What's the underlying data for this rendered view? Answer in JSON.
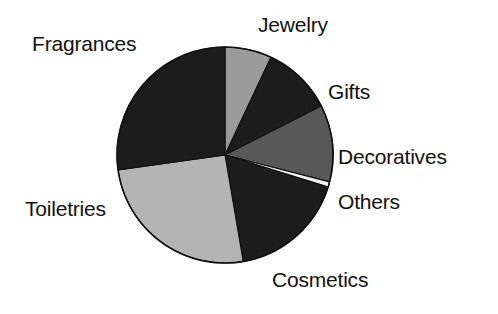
{
  "chart_data": {
    "type": "pie",
    "title": "",
    "subtitle": "",
    "xlabel": "",
    "ylabel": "",
    "legend_position": "none",
    "grid": false,
    "labels_outside": true,
    "start_angle_deg": 0,
    "direction": "clockwise",
    "center": {
      "x": 225,
      "y": 155
    },
    "radius": 108,
    "categories": [
      "Jewelry",
      "Gifts",
      "Decoratives",
      "Others",
      "Cosmetics",
      "Toiletries",
      "Fragrances"
    ],
    "values": [
      7.0,
      10.5,
      11.5,
      0.8,
      17.5,
      25.5,
      27.2
    ],
    "unit": "%",
    "slices": [
      {
        "label": "Jewelry",
        "value": 7.0,
        "start_deg": 0.0,
        "end_deg": 25.2,
        "color": "#9a9a9a"
      },
      {
        "label": "Gifts",
        "value": 10.5,
        "start_deg": 25.2,
        "end_deg": 63.0,
        "color": "#1c1c1c"
      },
      {
        "label": "Decoratives",
        "value": 11.5,
        "start_deg": 63.0,
        "end_deg": 104.4,
        "color": "#585858"
      },
      {
        "label": "Others",
        "value": 0.8,
        "start_deg": 104.4,
        "end_deg": 107.3,
        "color": "#f2f2f2"
      },
      {
        "label": "Cosmetics",
        "value": 17.5,
        "start_deg": 107.3,
        "end_deg": 170.3,
        "color": "#1c1c1c"
      },
      {
        "label": "Toiletries",
        "value": 25.5,
        "start_deg": 170.3,
        "end_deg": 262.1,
        "color": "#b4b4b4"
      },
      {
        "label": "Fragrances",
        "value": 27.2,
        "start_deg": 262.1,
        "end_deg": 360.0,
        "color": "#1c1c1c"
      }
    ],
    "colors": {
      "jewelry": "#9a9a9a",
      "gifts": "#1c1c1c",
      "decoratives": "#585858",
      "others": "#f2f2f2",
      "cosmetics": "#1c1c1c",
      "toiletries": "#b4b4b4",
      "fragrances": "#1c1c1c",
      "outline": "#111111",
      "background": "#ffffff",
      "label_text": "#111111"
    }
  },
  "labels": {
    "fragrances": "Fragrances",
    "jewelry": "Jewelry",
    "gifts": "Gifts",
    "decoratives": "Decoratives",
    "others": "Others",
    "cosmetics": "Cosmetics",
    "toiletries": "Toiletries"
  }
}
